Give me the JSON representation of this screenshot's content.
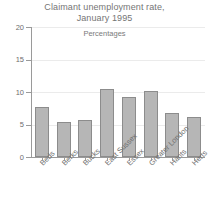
{
  "chart_data": {
    "type": "bar",
    "title": "Claimant unemployment rate, January 1995",
    "title_line1": "Claimant unemployment rate,",
    "title_line2": "January 1995",
    "subtitle": "Percentages",
    "xlabel": "",
    "ylabel": "",
    "ylim": [
      0,
      20
    ],
    "yticks": [
      0,
      5,
      10,
      15,
      20
    ],
    "ytick_labels": [
      "0",
      "5",
      "10",
      "15",
      "20"
    ],
    "grid": true,
    "legend": false,
    "bar_color": "#b6b6b6",
    "bar_edge_color": "#8c8c8c",
    "categories": [
      "Beds",
      "Berks",
      "Bucks",
      "East Sussex",
      "Essex",
      "Greater London",
      "Hants",
      "Herts"
    ],
    "values": [
      7.7,
      5.4,
      5.7,
      10.5,
      9.2,
      10.1,
      6.8,
      6.2
    ]
  },
  "next_chart": {
    "ytick_label_top": "20",
    "subtitle": "Percentages"
  }
}
